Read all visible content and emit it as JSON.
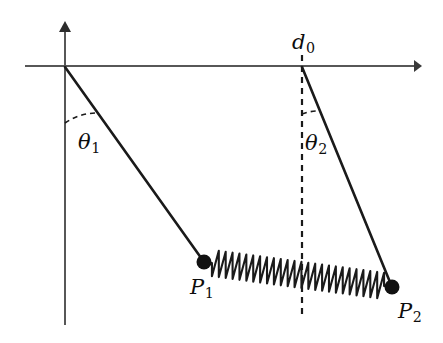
{
  "figure": {
    "background_color": "#ffffff",
    "stroke_color": "#1a1a1a",
    "axis_color": "#555555",
    "width": 443,
    "height": 343
  },
  "axes": {
    "origin": {
      "x": 65,
      "y": 67
    },
    "horizontal": {
      "x_start": 25,
      "x_end": 420,
      "y": 66,
      "arrow": "right"
    },
    "vertical": {
      "y_start": 25,
      "y_end": 325,
      "x": 65,
      "arrow": "up"
    }
  },
  "labels": {
    "theta1": {
      "base": "θ",
      "sub": "1",
      "x": 78,
      "y": 132
    },
    "theta2": {
      "base": "θ",
      "sub": "2",
      "x": 305,
      "y": 133
    },
    "d0": {
      "base": "d",
      "sub": "0",
      "x": 292,
      "y": 32
    },
    "p1": {
      "base": "P",
      "sub": "1",
      "x": 190,
      "y": 277
    },
    "p2": {
      "base": "P",
      "sub": "2",
      "x": 398,
      "y": 301
    }
  },
  "pendulums": [
    {
      "name": "pendulum-1",
      "pivot": {
        "x": 65,
        "y": 67
      },
      "bob": {
        "x": 204,
        "y": 262
      },
      "bob_radius": 7,
      "angle_from_vertical_deg": 35.5,
      "angle_label": "theta1"
    },
    {
      "name": "pendulum-2",
      "pivot": {
        "x": 302,
        "y": 67
      },
      "bob": {
        "x": 392,
        "y": 287
      },
      "bob_radius": 7,
      "angle_from_vertical_deg": 22.2,
      "angle_label": "theta2"
    }
  ],
  "reference_line": {
    "name": "d0-dashed-vertical",
    "x": 302,
    "y_start": 55,
    "y_end": 318,
    "dash": "5,5"
  },
  "angle_arcs": [
    {
      "name": "theta1-arc",
      "center": {
        "x": 65,
        "y": 67
      },
      "radius": 56,
      "dash": "5,4"
    },
    {
      "name": "theta2-arc",
      "center": {
        "x": 302,
        "y": 67
      },
      "radius": 47,
      "dash": "5,4"
    }
  ],
  "spring": {
    "name": "coupling-spring",
    "from": {
      "x": 204,
      "y": 262
    },
    "to": {
      "x": 392,
      "y": 287
    },
    "coils": 25,
    "amplitude": 13
  },
  "chart_data": {
    "type": "diagram",
    "elements": [
      "vertical-axis",
      "horizontal-axis",
      "rod-1",
      "rod-2",
      "bob-P1",
      "bob-P2",
      "spring",
      "d0-dashed-line",
      "theta1-arc",
      "theta2-arc"
    ],
    "annotations": [
      "θ₁",
      "θ₂",
      "d₀",
      "P₁",
      "P₂"
    ]
  }
}
